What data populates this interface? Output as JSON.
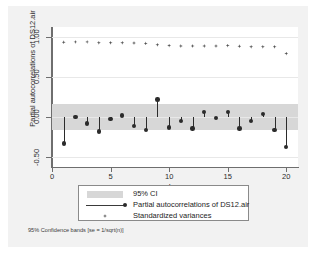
{
  "chart_data": {
    "type": "scatter",
    "title": "",
    "xlabel": "Lag",
    "ylabel": "Partial autocorrelations of DS12.air",
    "xlim": [
      0,
      21
    ],
    "ylim": [
      -0.62,
      1.12
    ],
    "xticks": [
      "0",
      "5",
      "10",
      "15",
      "20"
    ],
    "xtick_values": [
      0,
      5,
      10,
      15,
      20
    ],
    "yticks": [
      "-0.50",
      "0.00",
      "0.50",
      "1.00"
    ],
    "ytick_values": [
      -0.5,
      0.0,
      0.5,
      1.0
    ],
    "grid": true,
    "legend_position": "below-plot",
    "ci": {
      "label": "95% CI",
      "upper": 0.165,
      "lower": -0.165,
      "color": "#d7d7d7"
    },
    "x": [
      1,
      2,
      3,
      4,
      5,
      6,
      7,
      8,
      9,
      10,
      11,
      12,
      13,
      14,
      15,
      16,
      17,
      18,
      19,
      20
    ],
    "series": [
      {
        "name": "Partial autocorrelations of DS12.air",
        "type": "stem",
        "color": "#2b2b2b",
        "values": [
          -0.33,
          0.0,
          -0.08,
          -0.18,
          -0.02,
          0.02,
          -0.11,
          -0.16,
          0.22,
          -0.13,
          -0.05,
          -0.14,
          0.06,
          -0.01,
          0.06,
          -0.14,
          -0.05,
          0.04,
          -0.16,
          -0.37
        ]
      },
      {
        "name": "Standardized variances",
        "type": "marker",
        "color": "#555555",
        "values": [
          0.93,
          0.935,
          0.935,
          0.925,
          0.925,
          0.925,
          0.92,
          0.915,
          0.9,
          0.89,
          0.885,
          0.885,
          0.885,
          0.885,
          0.89,
          0.88,
          0.875,
          0.875,
          0.875,
          0.79
        ]
      }
    ],
    "footnote": "95% Confidence bands [se = 1/sqrt(n)]"
  },
  "legend": {
    "items": [
      {
        "label": "95% CI",
        "key": "band-swatch"
      },
      {
        "label": "Partial autocorrelations of DS12.air",
        "key": "line-marker"
      },
      {
        "label": "Standardized variances",
        "key": "diamond-marker"
      }
    ]
  },
  "axes": {
    "x_title": "Lag",
    "y_title": "Partial autocorrelations of DS12.air"
  }
}
